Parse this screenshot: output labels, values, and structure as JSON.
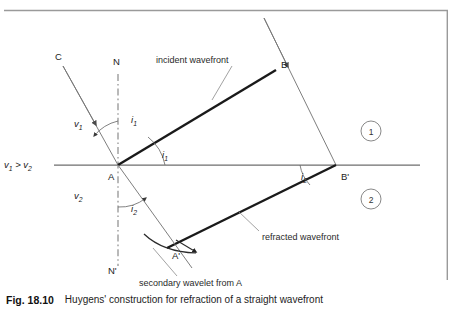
{
  "figure": {
    "caption_number": "Fig. 18.10",
    "caption_text": "Huygens' construction for refraction of a straight wavefront",
    "frame_color": "#8a8a8a",
    "line_color": "#6e6e6e",
    "bold_line_color": "#1a1a1a",
    "background": "#ffffff"
  },
  "points": [
    {
      "id": "C",
      "label": "C",
      "x": 58,
      "y": 62,
      "lx": 55,
      "ly": 60
    },
    {
      "id": "N",
      "label": "N",
      "x": 118,
      "y": 68,
      "lx": 113,
      "ly": 65
    },
    {
      "id": "B",
      "label": "B",
      "x": 276,
      "y": 70,
      "lx": 281,
      "ly": 68
    },
    {
      "id": "A",
      "label": "A",
      "x": 118,
      "y": 165,
      "lx": 110,
      "ly": 178
    },
    {
      "id": "Bp",
      "label": "B'",
      "x": 336,
      "y": 165,
      "lx": 341,
      "ly": 178
    },
    {
      "id": "Ap",
      "label": "A'",
      "x": 168,
      "y": 248,
      "lx": 172,
      "ly": 258
    },
    {
      "id": "Np",
      "label": "N'",
      "x": 118,
      "y": 262,
      "lx": 110,
      "ly": 272
    }
  ],
  "angles": [
    {
      "id": "i1-upper",
      "base": "i",
      "sub": "1",
      "x": 131,
      "y": 123
    },
    {
      "id": "i1-lower",
      "base": "i",
      "sub": "1",
      "x": 162,
      "y": 158
    },
    {
      "id": "i2-left",
      "base": "i",
      "sub": "2",
      "x": 131,
      "y": 209
    },
    {
      "id": "i2-right",
      "base": "i",
      "sub": "2",
      "x": 301,
      "y": 179
    }
  ],
  "velocities": [
    {
      "id": "v1",
      "base": "v",
      "sub": "1",
      "x": 74,
      "y": 124
    },
    {
      "id": "v2",
      "base": "v",
      "sub": "2",
      "x": 74,
      "y": 196
    }
  ],
  "comparison": {
    "text_v": "v",
    "sub_1": "1",
    "relation": " > ",
    "text_v2": "v",
    "sub_2": "2",
    "x": 6,
    "y": 168
  },
  "annotations": [
    {
      "id": "incident-wavefront",
      "text": "incident wavefront",
      "x": 156,
      "y": 60,
      "leader": {
        "x1": 232,
        "y1": 66,
        "x2": 212,
        "y2": 100
      }
    },
    {
      "id": "refracted-wavefront",
      "text": "refracted wavefront",
      "x": 262,
      "y": 237,
      "leader": {
        "x1": 259,
        "y1": 230,
        "x2": 238,
        "y2": 212
      }
    },
    {
      "id": "secondary-wavelet",
      "text": "secondary wavelet from A",
      "x": 140,
      "y": 283,
      "leader": {
        "x1": 176,
        "y1": 276,
        "x2": 152,
        "y2": 248
      }
    }
  ],
  "regions": [
    {
      "id": "region-1",
      "label": "1",
      "cx": 371,
      "cy": 131,
      "r": 10
    },
    {
      "id": "region-2",
      "label": "2",
      "cx": 371,
      "cy": 199,
      "r": 10
    }
  ],
  "geometry": {
    "interface": {
      "x1": 54,
      "y1": 165,
      "x2": 420,
      "y2": 165
    },
    "normal": {
      "x1": 118,
      "y1": 74,
      "x2": 118,
      "y2": 266
    },
    "incident_ray_c": {
      "x1": 63,
      "y1": 66,
      "x2": 118,
      "y2": 165
    },
    "incident_ray_b": {
      "x1": 264,
      "y1": 18,
      "x2": 336,
      "y2": 165
    },
    "incident_wavefront": {
      "x1": 118,
      "y1": 165,
      "x2": 276,
      "y2": 70
    },
    "refracted_wavefront": {
      "x1": 168,
      "y1": 248,
      "x2": 336,
      "y2": 165
    },
    "refracted_ray": {
      "x1": 118,
      "y1": 165,
      "x2": 192,
      "y2": 268
    },
    "frame": {
      "top_y": 10,
      "right_x": 448,
      "bottom_y": 280,
      "left_x": 4
    }
  }
}
